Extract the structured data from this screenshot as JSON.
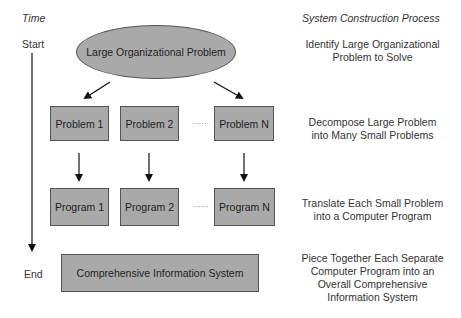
{
  "headers": {
    "time": "Time",
    "process": "System Construction Process"
  },
  "timeline": {
    "start": "Start",
    "end": "End"
  },
  "nodes": {
    "large_problem": "Large Organizational Problem",
    "problems": [
      "Problem 1",
      "Problem 2",
      "Problem N"
    ],
    "programs": [
      "Program 1",
      "Program 2",
      "Program N"
    ],
    "ellipsis": "......",
    "system": "Comprehensive Information System"
  },
  "steps": [
    {
      "line1": "Identify Large Organizational",
      "line2": "Problem to Solve"
    },
    {
      "line1": "Decompose Large Problem",
      "line2": "into Many Small Problems"
    },
    {
      "line1": "Translate Each Small Problem",
      "line2": "into a Computer Program"
    },
    {
      "line1": "Piece Together Each Separate",
      "line2": "Computer Program into an",
      "line3": "Overall Comprehensive",
      "line4": "Information System"
    }
  ],
  "colors": {
    "shape_fill": "#a9a9a9",
    "shape_border": "#555555",
    "arrow": "#111111"
  }
}
